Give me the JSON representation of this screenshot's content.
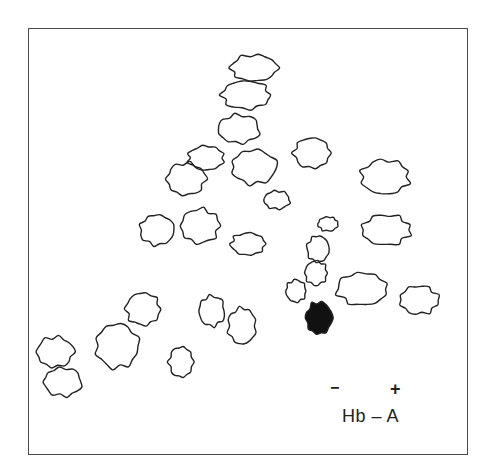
{
  "figure": {
    "type": "2D hemoglobin peptide map (fingerprint)",
    "polarity": {
      "negative": "−",
      "positive": "+"
    },
    "label": "Hb – A",
    "stroke_color": "#222222",
    "filled_spot_color": "#111111"
  },
  "spots": [
    {
      "id": 1,
      "cx": 254,
      "cy": 68,
      "rx": 23,
      "ry": 13,
      "filled": false
    },
    {
      "id": 2,
      "cx": 246,
      "cy": 95,
      "rx": 24,
      "ry": 14,
      "filled": false
    },
    {
      "id": 3,
      "cx": 239,
      "cy": 129,
      "rx": 21,
      "ry": 14,
      "filled": false
    },
    {
      "id": 4,
      "cx": 206,
      "cy": 158,
      "rx": 18,
      "ry": 12,
      "filled": false
    },
    {
      "id": 5,
      "cx": 254,
      "cy": 167,
      "rx": 22,
      "ry": 17,
      "filled": false
    },
    {
      "id": 6,
      "cx": 186,
      "cy": 179,
      "rx": 19,
      "ry": 16,
      "filled": false
    },
    {
      "id": 7,
      "cx": 312,
      "cy": 153,
      "rx": 18,
      "ry": 15,
      "filled": false
    },
    {
      "id": 8,
      "cx": 277,
      "cy": 200,
      "rx": 13,
      "ry": 9,
      "filled": false
    },
    {
      "id": 9,
      "cx": 385,
      "cy": 177,
      "rx": 24,
      "ry": 17,
      "filled": false
    },
    {
      "id": 10,
      "cx": 157,
      "cy": 230,
      "rx": 17,
      "ry": 15,
      "filled": false
    },
    {
      "id": 11,
      "cx": 200,
      "cy": 226,
      "rx": 19,
      "ry": 17,
      "filled": false
    },
    {
      "id": 12,
      "cx": 248,
      "cy": 244,
      "rx": 17,
      "ry": 11,
      "filled": false
    },
    {
      "id": 13,
      "cx": 328,
      "cy": 224,
      "rx": 10,
      "ry": 7,
      "filled": false
    },
    {
      "id": 14,
      "cx": 386,
      "cy": 230,
      "rx": 24,
      "ry": 15,
      "filled": false
    },
    {
      "id": 15,
      "cx": 318,
      "cy": 249,
      "rx": 11,
      "ry": 13,
      "filled": false
    },
    {
      "id": 16,
      "cx": 316,
      "cy": 273,
      "rx": 11,
      "ry": 12,
      "filled": false
    },
    {
      "id": 17,
      "cx": 296,
      "cy": 291,
      "rx": 10,
      "ry": 11,
      "filled": false
    },
    {
      "id": 18,
      "cx": 362,
      "cy": 289,
      "rx": 25,
      "ry": 16,
      "filled": false
    },
    {
      "id": 19,
      "cx": 419,
      "cy": 300,
      "rx": 19,
      "ry": 14,
      "filled": false
    },
    {
      "id": 20,
      "cx": 319,
      "cy": 318,
      "rx": 13,
      "ry": 16,
      "filled": true
    },
    {
      "id": 21,
      "cx": 143,
      "cy": 309,
      "rx": 17,
      "ry": 16,
      "filled": false
    },
    {
      "id": 22,
      "cx": 212,
      "cy": 311,
      "rx": 13,
      "ry": 15,
      "filled": false
    },
    {
      "id": 23,
      "cx": 242,
      "cy": 326,
      "rx": 14,
      "ry": 18,
      "filled": false
    },
    {
      "id": 24,
      "cx": 117,
      "cy": 346,
      "rx": 21,
      "ry": 22,
      "filled": false
    },
    {
      "id": 25,
      "cx": 55,
      "cy": 352,
      "rx": 18,
      "ry": 15,
      "filled": false
    },
    {
      "id": 26,
      "cx": 181,
      "cy": 362,
      "rx": 12,
      "ry": 15,
      "filled": false
    },
    {
      "id": 27,
      "cx": 63,
      "cy": 382,
      "rx": 19,
      "ry": 14,
      "filled": false
    }
  ]
}
